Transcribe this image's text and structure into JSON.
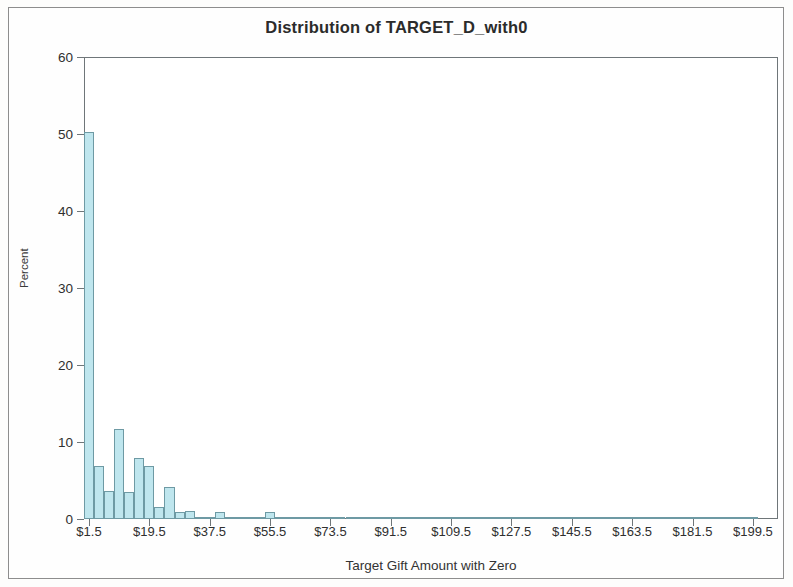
{
  "chart_data": {
    "type": "bar",
    "title": "Distribution of TARGET_D_with0",
    "subtitle": "",
    "xlabel": "Target Gift Amount with Zero",
    "ylabel": "Percent",
    "ylim": [
      0,
      60
    ],
    "yticks": [
      0,
      10,
      20,
      30,
      40,
      50,
      60
    ],
    "ytick_labels": [
      "0",
      "10",
      "20",
      "30",
      "40",
      "50",
      "60"
    ],
    "xlim": [
      0,
      207
    ],
    "xticks": [
      1.5,
      19.5,
      37.5,
      55.5,
      73.5,
      91.5,
      109.5,
      127.5,
      145.5,
      163.5,
      181.5,
      199.5
    ],
    "xtick_labels": [
      "$1.5",
      "$19.5",
      "$37.5",
      "$55.5",
      "$73.5",
      "$91.5",
      "$109.5",
      "$127.5",
      "$145.5",
      "$163.5",
      "$181.5",
      "$199.5"
    ],
    "grid": false,
    "legend": null,
    "bin_width": 3,
    "bin_centers": [
      1.5,
      4.5,
      7.5,
      10.5,
      13.5,
      16.5,
      19.5,
      22.5,
      25.5,
      28.5,
      31.5,
      34.5,
      37.5,
      40.5,
      43.5,
      46.5,
      49.5,
      52.5,
      55.5,
      58.5,
      61.5,
      64.5,
      67.5,
      70.5,
      73.5,
      76.5,
      79.5,
      82.5,
      85.5,
      88.5,
      91.5,
      94.5,
      97.5,
      100.5,
      103.5,
      106.5,
      109.5,
      112.5,
      115.5,
      118.5,
      121.5,
      124.5,
      127.5,
      130.5,
      133.5,
      136.5,
      139.5,
      142.5,
      145.5,
      148.5,
      151.5,
      154.5,
      157.5,
      160.5,
      163.5,
      166.5,
      169.5,
      172.5,
      175.5,
      178.5,
      181.5,
      184.5,
      187.5,
      190.5,
      193.5,
      196.5,
      199.5
    ],
    "categories": [
      "$1.5",
      "$4.5",
      "$7.5",
      "$10.5",
      "$13.5",
      "$16.5",
      "$19.5",
      "$22.5",
      "$25.5",
      "$28.5",
      "$31.5",
      "$34.5",
      "$37.5",
      "$40.5",
      "$43.5",
      "$46.5",
      "$49.5",
      "$52.5",
      "$55.5",
      "$58.5",
      "$61.5",
      "$64.5",
      "$67.5",
      "$70.5",
      "$73.5",
      "$76.5",
      "$79.5",
      "$82.5",
      "$85.5",
      "$88.5",
      "$91.5",
      "$94.5",
      "$97.5",
      "$100.5",
      "$103.5",
      "$106.5",
      "$109.5",
      "$112.5",
      "$115.5",
      "$118.5",
      "$121.5",
      "$124.5",
      "$127.5",
      "$130.5",
      "$133.5",
      "$136.5",
      "$139.5",
      "$142.5",
      "$145.5",
      "$148.5",
      "$151.5",
      "$154.5",
      "$157.5",
      "$160.5",
      "$163.5",
      "$166.5",
      "$169.5",
      "$172.5",
      "$175.5",
      "$178.5",
      "$181.5",
      "$184.5",
      "$187.5",
      "$190.5",
      "$193.5",
      "$196.5",
      "$199.5"
    ],
    "values": [
      50.3,
      6.9,
      3.7,
      11.7,
      3.5,
      7.9,
      6.9,
      1.6,
      4.2,
      0.9,
      1.0,
      0.3,
      0.3,
      0.9,
      0.1,
      0.1,
      0.05,
      0.05,
      0.9,
      0.05,
      0.05,
      0.05,
      0.05,
      0.05,
      0.1,
      0.05,
      0.05,
      0.05,
      0.05,
      0.05,
      0.05,
      0.05,
      0.05,
      0.05,
      0.3,
      0.05,
      0.05,
      0.05,
      0.05,
      0.05,
      0.05,
      0.05,
      0.05,
      0.05,
      0.05,
      0.05,
      0.05,
      0.05,
      0.05,
      0.05,
      0.05,
      0.05,
      0.05,
      0.05,
      0.05,
      0.05,
      0.05,
      0.05,
      0.05,
      0.05,
      0.05,
      0.05,
      0.05,
      0.05,
      0.05,
      0.05,
      0.05
    ]
  },
  "colors": {
    "bar_fill": "#bfe6ee",
    "bar_edge": "#6e9aa4",
    "axis": "#6f7679",
    "text": "#2f2f2f"
  }
}
